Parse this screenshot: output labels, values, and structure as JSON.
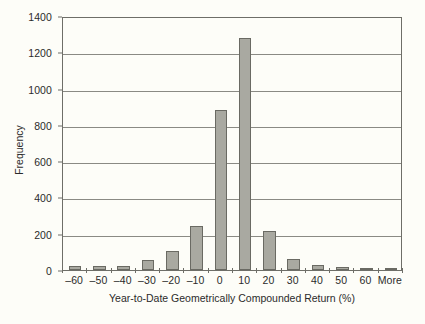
{
  "chart_data": {
    "type": "bar",
    "title": "",
    "xlabel": "Year-to-Date Geometrically Compounded Return (%)",
    "ylabel": "Frequency",
    "categories": [
      "–60",
      "–50",
      "–40",
      "–30",
      "–20",
      "–10",
      "0",
      "10",
      "20",
      "30",
      "40",
      "50",
      "60",
      "More"
    ],
    "values": [
      20,
      20,
      20,
      55,
      105,
      240,
      880,
      1280,
      215,
      60,
      30,
      15,
      8,
      5
    ],
    "ylim": [
      0,
      1400
    ],
    "y_ticks": [
      0,
      200,
      400,
      600,
      800,
      1000,
      1200,
      1400
    ],
    "y_tick_labels": [
      "0",
      "200",
      "400",
      "600",
      "800",
      "1000",
      "1200",
      "1400"
    ],
    "grid": true,
    "legend": "none",
    "bar_color": "#a9a9a1",
    "bar_border_color": "#6a6a63",
    "axis_color": "#6e6e68",
    "gridline_color": "#8a8a84",
    "background_color": "#fdfdf8"
  }
}
